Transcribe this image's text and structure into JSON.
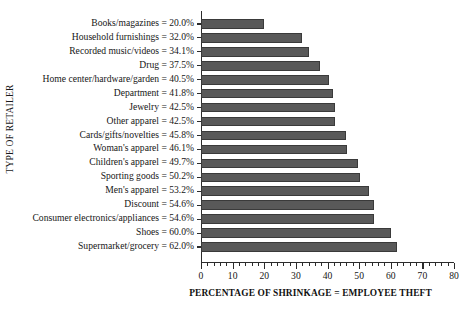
{
  "chart_data": {
    "type": "bar",
    "orientation": "horizontal",
    "title": "",
    "xlabel": "PERCENTAGE OF SHRINKAGE = EMPLOYEE THEFT",
    "ylabel": "TYPE OF RETAILER",
    "xlim": [
      0,
      80
    ],
    "xticks": [
      0,
      10,
      20,
      30,
      40,
      50,
      60,
      70,
      80
    ],
    "xtick_labels": [
      "0",
      "10",
      "20",
      "30",
      "40",
      "50",
      "60",
      "70",
      "80"
    ],
    "minor_tick_step": 2,
    "grid": false,
    "legend": false,
    "bar_color": "#595959",
    "bar_edge_color": "#3a3a3a",
    "axis_color": "#2b2b2b",
    "background_color": "#ffffff",
    "categories": [
      "Books/magazines",
      "Household furnishings",
      "Recorded music/videos",
      "Drug",
      "Home center/hardware/garden",
      "Department",
      "Jewelry",
      "Other apparel",
      "Cards/gifts/novelties",
      "Woman's apparel",
      "Children's apparel",
      "Sporting goods",
      "Men's apparel",
      "Discount",
      "Consumer electronics/appliances",
      "Shoes",
      "Supermarket/grocery"
    ],
    "values": [
      20.0,
      32.0,
      34.1,
      37.5,
      40.5,
      41.8,
      42.5,
      42.5,
      45.8,
      46.1,
      49.7,
      50.2,
      53.2,
      54.6,
      54.6,
      60.0,
      62.0
    ],
    "category_labels": [
      "Books/magazines = 20.0%",
      "Household furnishings = 32.0%",
      "Recorded music/videos = 34.1%",
      "Drug = 37.5%",
      "Home center/hardware/garden = 40.5%",
      "Department = 41.8%",
      "Jewelry = 42.5%",
      "Other apparel = 42.5%",
      "Cards/gifts/novelties = 45.8%",
      "Woman's apparel = 46.1%",
      "Children's apparel = 49.7%",
      "Sporting goods = 50.2%",
      "Men's apparel = 53.2%",
      "Discount = 54.6%",
      "Consumer electronics/appliances = 54.6%",
      "Shoes = 60.0%",
      "Supermarket/grocery = 62.0%"
    ]
  }
}
